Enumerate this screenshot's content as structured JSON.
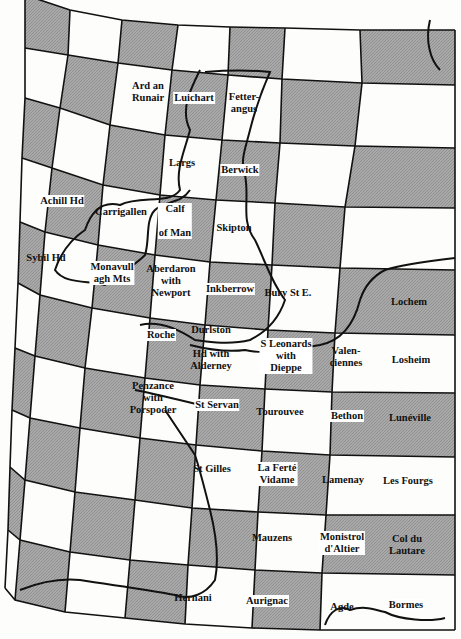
{
  "map": {
    "title": "Map sheet index grid — British Isles and France",
    "shaded_color": "#a9a9a9",
    "line_color": "#111111",
    "sheets": [
      {
        "name": "Ard an Runair",
        "lines": [
          "Ard an",
          "Runair"
        ],
        "x": 148,
        "y": 92,
        "boxed": false
      },
      {
        "name": "Luichart",
        "lines": [
          "Luichart"
        ],
        "x": 194,
        "y": 98,
        "boxed": true
      },
      {
        "name": "Fetter-angus",
        "lines": [
          "Fetter-",
          "angus"
        ],
        "x": 244,
        "y": 103,
        "boxed": false
      },
      {
        "name": "Largs",
        "lines": [
          "Largs"
        ],
        "x": 182,
        "y": 163,
        "boxed": false
      },
      {
        "name": "Berwick",
        "lines": [
          "Berwick"
        ],
        "x": 240,
        "y": 170,
        "boxed": true
      },
      {
        "name": "Achill Hd",
        "lines": [
          "Achill Hd"
        ],
        "x": 62,
        "y": 201,
        "boxed": true
      },
      {
        "name": "Carrigallen",
        "lines": [
          "Carrigallen"
        ],
        "x": 121,
        "y": 212,
        "boxed": false
      },
      {
        "name": "Calf of Man",
        "lines": [
          "Calf",
          "",
          "of Man"
        ],
        "x": 175,
        "y": 221,
        "boxed": true
      },
      {
        "name": "Skipton",
        "lines": [
          "Skipton"
        ],
        "x": 234,
        "y": 228,
        "boxed": false
      },
      {
        "name": "Sybil Hd",
        "lines": [
          "Sybil Hd"
        ],
        "x": 46,
        "y": 258,
        "boxed": false
      },
      {
        "name": "Monavullagh Mts",
        "lines": [
          "Monavull",
          "agh Mts"
        ],
        "x": 112,
        "y": 273,
        "boxed": true
      },
      {
        "name": "Aberdaron with Newport",
        "lines": [
          "Aberdaron",
          "with",
          "Newport"
        ],
        "x": 171,
        "y": 281,
        "boxed": false
      },
      {
        "name": "Inkberrow",
        "lines": [
          "Inkberrow"
        ],
        "x": 230,
        "y": 289,
        "boxed": true
      },
      {
        "name": "Bury St E.",
        "lines": [
          "Bury St E."
        ],
        "x": 288,
        "y": 293,
        "boxed": false
      },
      {
        "name": "Lochem",
        "lines": [
          "Lochem"
        ],
        "x": 409,
        "y": 302,
        "boxed": false
      },
      {
        "name": "Roche",
        "lines": [
          "Roche"
        ],
        "x": 161,
        "y": 335,
        "boxed": true
      },
      {
        "name": "Durlston Hd with Alderney",
        "lines": [
          "Durlston",
          "",
          "Hd with",
          "Alderney"
        ],
        "x": 211,
        "y": 348,
        "boxed": false
      },
      {
        "name": "S Leonards with Dieppe",
        "lines": [
          "S Leonards",
          "with",
          "Dieppe"
        ],
        "x": 286,
        "y": 356,
        "boxed": true
      },
      {
        "name": "Valenciennes",
        "lines": [
          "Valen-",
          "ciennes"
        ],
        "x": 346,
        "y": 357,
        "boxed": false
      },
      {
        "name": "Losheim",
        "lines": [
          "Losheim"
        ],
        "x": 411,
        "y": 360,
        "boxed": true
      },
      {
        "name": "Penzance with Porspoder",
        "lines": [
          "Penzance",
          "with",
          "Porspoder"
        ],
        "x": 153,
        "y": 398,
        "boxed": false
      },
      {
        "name": "St Servan",
        "lines": [
          "St Servan"
        ],
        "x": 217,
        "y": 405,
        "boxed": true
      },
      {
        "name": "Tourouvee",
        "lines": [
          "Tourouvee"
        ],
        "x": 280,
        "y": 412,
        "boxed": false
      },
      {
        "name": "Bethon",
        "lines": [
          "Bethon"
        ],
        "x": 347,
        "y": 416,
        "boxed": true
      },
      {
        "name": "Lunéville",
        "lines": [
          "Lunéville"
        ],
        "x": 410,
        "y": 418,
        "boxed": false
      },
      {
        "name": "St Gilles",
        "lines": [
          "St Gilles"
        ],
        "x": 212,
        "y": 469,
        "boxed": false
      },
      {
        "name": "La Ferté Vidame",
        "lines": [
          "La Ferté",
          "Vidame"
        ],
        "x": 277,
        "y": 474,
        "boxed": true
      },
      {
        "name": "Lamenay",
        "lines": [
          "Lamenay"
        ],
        "x": 343,
        "y": 480,
        "boxed": false
      },
      {
        "name": "Les Fourgs",
        "lines": [
          "Les Fourgs"
        ],
        "x": 408,
        "y": 481,
        "boxed": true
      },
      {
        "name": "Mauzens",
        "lines": [
          "Mauzens"
        ],
        "x": 272,
        "y": 538,
        "boxed": false
      },
      {
        "name": "Monistrol d'Altier",
        "lines": [
          "Monistrol",
          "d'Altier"
        ],
        "x": 342,
        "y": 543,
        "boxed": true
      },
      {
        "name": "Col du Lautare",
        "lines": [
          "Col du",
          "Lautare"
        ],
        "x": 407,
        "y": 545,
        "boxed": false
      },
      {
        "name": "Hernani",
        "lines": [
          "Hernani"
        ],
        "x": 193,
        "y": 598,
        "boxed": false
      },
      {
        "name": "Aurignac",
        "lines": [
          "Aurignac"
        ],
        "x": 267,
        "y": 601,
        "boxed": true
      },
      {
        "name": "Agde",
        "lines": [
          "Agde"
        ],
        "x": 342,
        "y": 607,
        "boxed": false
      },
      {
        "name": "Bormes",
        "lines": [
          "Bormes"
        ],
        "x": 406,
        "y": 605,
        "boxed": true
      }
    ]
  }
}
